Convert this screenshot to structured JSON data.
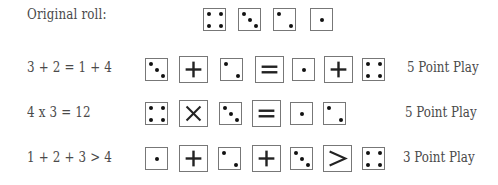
{
  "rows": [
    {
      "label": "Original roll:",
      "tokens": [
        {
          "type": "die",
          "value": 4
        },
        {
          "type": "die",
          "value": 3
        },
        {
          "type": "die",
          "value": 2
        },
        {
          "type": "die",
          "value": 1
        }
      ],
      "points": ""
    },
    {
      "label": "3 + 2 = 1 + 4",
      "tokens": [
        {
          "type": "die",
          "value": 3
        },
        {
          "type": "op",
          "symbol": "plus"
        },
        {
          "type": "die",
          "value": 2
        },
        {
          "type": "op",
          "symbol": "equals"
        },
        {
          "type": "die",
          "value": 1
        },
        {
          "type": "op",
          "symbol": "plus"
        },
        {
          "type": "die",
          "value": 4
        }
      ],
      "points": "5 Point Play"
    },
    {
      "label": "4 x 3 = 12",
      "tokens": [
        {
          "type": "die",
          "value": 4
        },
        {
          "type": "op",
          "symbol": "times"
        },
        {
          "type": "die",
          "value": 3
        },
        {
          "type": "op",
          "symbol": "equals"
        },
        {
          "type": "die",
          "value": 1
        },
        {
          "type": "die",
          "value": 2
        }
      ],
      "points": "5 Point Play"
    },
    {
      "label": "1 + 2 + 3 > 4",
      "tokens": [
        {
          "type": "die",
          "value": 1
        },
        {
          "type": "op",
          "symbol": "plus"
        },
        {
          "type": "die",
          "value": 2
        },
        {
          "type": "op",
          "symbol": "plus"
        },
        {
          "type": "die",
          "value": 3
        },
        {
          "type": "op",
          "symbol": "greater-than"
        },
        {
          "type": "die",
          "value": 4
        }
      ],
      "points": "3 Point Play"
    }
  ]
}
